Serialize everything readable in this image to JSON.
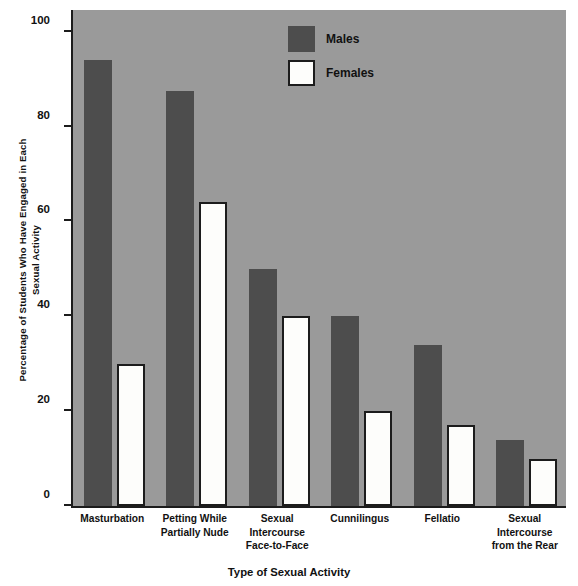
{
  "chart_data": {
    "type": "bar",
    "title": "",
    "xlabel": "Type of Sexual Activity",
    "ylabel": "Percentage of Students Who Have Engaged in Each Sexual Activity",
    "ylabel_line1": "Percentage of Students Who Have Engaged in Each",
    "ylabel_line2": "Sexual Activity",
    "categories": [
      "Masturbation",
      "Petting While Partially Nude",
      "Sexual Intercourse Face-to-Face",
      "Cunnilingus",
      "Fellatio",
      "Sexual Intercourse from the Rear"
    ],
    "category_lines": [
      [
        "Masturbation"
      ],
      [
        "Petting While",
        "Partially Nude"
      ],
      [
        "Sexual",
        "Intercourse",
        "Face-to-Face"
      ],
      [
        "Cunnilingus"
      ],
      [
        "Fellatio"
      ],
      [
        "Sexual",
        "Intercourse",
        "from the Rear"
      ]
    ],
    "series": [
      {
        "name": "Males",
        "values": [
          94,
          87.5,
          50,
          40,
          34,
          14
        ],
        "color": "#4d4d4d"
      },
      {
        "name": "Females",
        "values": [
          30,
          64,
          40,
          20,
          17,
          10
        ],
        "color": "#fdfdfb"
      }
    ],
    "ylim": [
      0,
      105
    ],
    "yticks": [
      0,
      20,
      40,
      60,
      80,
      100
    ],
    "ytick_labels": [
      "0",
      "20",
      "40",
      "60",
      "80",
      "100"
    ],
    "grid": false,
    "legend_position": "top-center",
    "plot_background": "#9a9a9a",
    "axis_color": "#1c1c1c"
  },
  "legend": {
    "items": [
      {
        "label": "Males",
        "swatch": "male"
      },
      {
        "label": "Females",
        "swatch": "female"
      }
    ]
  }
}
